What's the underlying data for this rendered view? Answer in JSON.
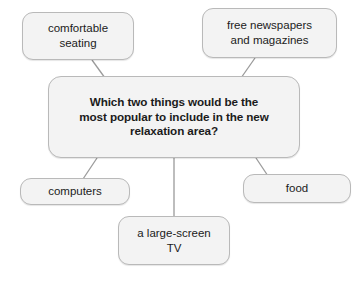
{
  "diagram": {
    "type": "mind-map",
    "title": "Which two things would be the most popular to include in the new relaxation area?",
    "central_node": {
      "id": "central",
      "text": "Which two things would be the\nmost popular to include in the new\nrelaxation area?"
    },
    "leaf_nodes": [
      {
        "id": "comfortable-seating",
        "text": "comfortable\nseating"
      },
      {
        "id": "free-newspapers",
        "text": "free newspapers\nand magazines"
      },
      {
        "id": "computers",
        "text": "computers"
      },
      {
        "id": "food",
        "text": "food"
      },
      {
        "id": "tv",
        "text": "a large-screen\nTV"
      }
    ],
    "connectors": [
      {
        "from": "comfortable-seating",
        "to": "central",
        "style": "diagonal"
      },
      {
        "from": "free-newspapers",
        "to": "central",
        "style": "diagonal"
      },
      {
        "from": "central",
        "to": "computers",
        "style": "diagonal"
      },
      {
        "from": "central",
        "to": "food",
        "style": "diagonal"
      },
      {
        "from": "central",
        "to": "tv",
        "style": "vertical"
      }
    ]
  },
  "colors": {
    "background": "#ffffff",
    "node_fill": "#f3f3f3",
    "node_border": "#b9b9b9",
    "connector": "#9a9a9a",
    "text": "#1b1b1b"
  }
}
